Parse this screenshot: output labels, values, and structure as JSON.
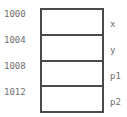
{
  "diagram": {
    "type": "memory-block-diagram",
    "colors": {
      "border": "#4a4a4a",
      "cell_background": "#ffffff",
      "label_text": "#6e6e6e",
      "page_background": "#ffffff"
    },
    "cells": [
      {
        "address": "1000",
        "variable": "x"
      },
      {
        "address": "1004",
        "variable": "y"
      },
      {
        "address": "1008",
        "variable": "p1"
      },
      {
        "address": "1012",
        "variable": "p2"
      }
    ]
  }
}
